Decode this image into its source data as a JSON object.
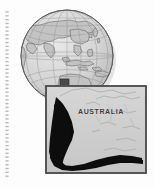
{
  "figure": {
    "page_background": "#fdfdfd",
    "binding": {
      "name": "spiral-binding-marks",
      "x": 7,
      "dash_count": 44,
      "color": "#b9b9b9"
    },
    "globe": {
      "name": "globe",
      "center_x": 67,
      "center_y": 56,
      "radius": 46,
      "ocean_color": "#d6d6d6",
      "land_color": "#c2c2c2",
      "outline_color": "#6d6d6d",
      "graticule_color": "#9a9a9a",
      "shadow_color": "#c9c9c9",
      "projection_center": "Asia-Pacific",
      "locator_box": {
        "name": "locator-box",
        "x": 60,
        "y": 79,
        "width": 9,
        "height": 9,
        "fill": "#4a4a4a"
      }
    },
    "callout": {
      "name": "callout-leader-lines",
      "color": "#8a8a8a"
    },
    "inset": {
      "name": "inset-map-australia",
      "label": "AUSTRALIA",
      "x": 46,
      "y": 86,
      "width": 100,
      "height": 87,
      "background": "#cfcfcf",
      "border_color": "#5d5d5d",
      "coastline_color": "#a0a0a0",
      "highlight_region_color": "#0b0b0b",
      "highlight_region_name": "shaded-study-area"
    }
  }
}
